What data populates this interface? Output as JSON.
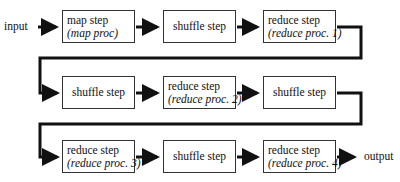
{
  "diagram": {
    "input_label": "input",
    "output_label": "output",
    "rows": [
      {
        "boxes": [
          {
            "title": "map step",
            "subtitle": "(map proc)"
          },
          {
            "title": "shuffle step",
            "subtitle": ""
          },
          {
            "title": "reduce step",
            "subtitle": "(reduce proc. 1)"
          }
        ]
      },
      {
        "boxes": [
          {
            "title": "shuffle step",
            "subtitle": ""
          },
          {
            "title": "reduce step",
            "subtitle": "(reduce proc. 2)"
          },
          {
            "title": "shuffle step",
            "subtitle": ""
          }
        ]
      },
      {
        "boxes": [
          {
            "title": "reduce step",
            "subtitle": "(reduce proc. 3)"
          },
          {
            "title": "shuffle step",
            "subtitle": ""
          },
          {
            "title": "reduce step",
            "subtitle": "(reduce proc. 4)"
          }
        ]
      }
    ],
    "colors": {
      "line": "#111111",
      "box_border": "#333333",
      "background": "#ffffff"
    }
  }
}
